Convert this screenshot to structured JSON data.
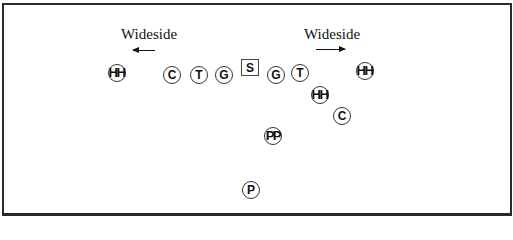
{
  "diagram": {
    "labels": {
      "left_wideside": "Wideside",
      "right_wideside": "Wideside"
    },
    "arrows": {
      "left": "arrow-left",
      "right": "arrow-right"
    },
    "snapper": "S",
    "players": [
      {
        "id": "hh-left",
        "label": "HH",
        "x": 117,
        "y": 73
      },
      {
        "id": "c-left",
        "label": "C",
        "x": 172,
        "y": 75
      },
      {
        "id": "t-left",
        "label": "T",
        "x": 199,
        "y": 75
      },
      {
        "id": "g-left",
        "label": "G",
        "x": 224,
        "y": 75
      },
      {
        "id": "g-right",
        "label": "G",
        "x": 276,
        "y": 75
      },
      {
        "id": "t-right",
        "label": "T",
        "x": 300,
        "y": 73
      },
      {
        "id": "hh-right",
        "label": "HH",
        "x": 365,
        "y": 71
      },
      {
        "id": "hh-mid",
        "label": "HH",
        "x": 320,
        "y": 95
      },
      {
        "id": "c-right",
        "label": "C",
        "x": 342,
        "y": 116
      },
      {
        "id": "pp",
        "label": "PP",
        "x": 273,
        "y": 136
      },
      {
        "id": "p",
        "label": "P",
        "x": 251,
        "y": 190
      }
    ]
  }
}
